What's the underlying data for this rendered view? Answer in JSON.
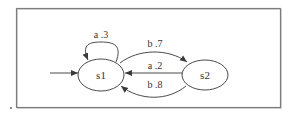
{
  "diagram": {
    "type": "state-machine",
    "colors": {
      "frame": "#7d7d7d",
      "stroke": "#4a4a4a",
      "text": "#333333",
      "background": "#ffffff"
    },
    "nodes": [
      {
        "id": "s1",
        "label": "s1",
        "initial": true
      },
      {
        "id": "s2",
        "label": "s2",
        "initial": false
      }
    ],
    "edges": [
      {
        "from": "s1",
        "to": "s1",
        "symbol": "a",
        "probability": ".3",
        "label": "a .3"
      },
      {
        "from": "s1",
        "to": "s2",
        "symbol": "b",
        "probability": ".7",
        "label": "b .7"
      },
      {
        "from": "s2",
        "to": "s1",
        "symbol": "a",
        "probability": ".2",
        "label": "a .2"
      },
      {
        "from": "s2",
        "to": "s1",
        "symbol": "b",
        "probability": ".8",
        "label": "b .8"
      }
    ]
  }
}
